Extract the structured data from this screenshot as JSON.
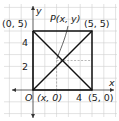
{
  "diagram": {
    "type": "coordinate-plane-geometry",
    "axes": {
      "x_label": "x",
      "y_label": "y",
      "origin_label": "O"
    },
    "tick_labels": {
      "y_2": "2",
      "y_4": "4",
      "x_4": "4"
    },
    "points": {
      "A": {
        "label": "(0, 5)",
        "x": 0,
        "y": 5
      },
      "B": {
        "label": "(5, 5)",
        "x": 5,
        "y": 5
      },
      "C": {
        "label": "(5, 0)",
        "x": 5,
        "y": 0
      },
      "D": {
        "label": "(x, 0)",
        "x": 2,
        "y": 0
      },
      "P": {
        "label": "P(x, y)",
        "x": 2,
        "y": 2.5
      }
    },
    "colors": {
      "grid": "#c8c8c8",
      "lines": "#111111",
      "dashed": "#9a9a9a"
    }
  }
}
